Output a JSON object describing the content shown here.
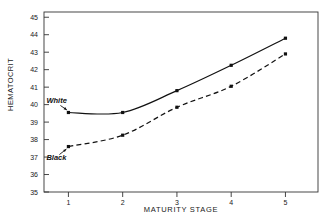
{
  "chart_data": {
    "type": "line",
    "title": "",
    "xlabel": "MATURITY STAGE",
    "ylabel": "HEMATOCRIT",
    "categories": [
      "1",
      "2",
      "3",
      "4",
      "5"
    ],
    "x": [
      1,
      2,
      3,
      4,
      5
    ],
    "xlim": [
      0.55,
      5.6
    ],
    "ylim": [
      35,
      45.3
    ],
    "ytick_labels": [
      "45",
      "44",
      "43",
      "42",
      "41",
      "40",
      "39",
      "38",
      "37",
      "36",
      "35"
    ],
    "yticks": [
      45,
      44,
      43,
      42,
      41,
      40,
      39,
      38,
      37,
      36,
      35
    ],
    "xtick_labels": [
      "1",
      "2",
      "3",
      "4",
      "5"
    ],
    "grid": false,
    "legend_position": "inline-annotations",
    "series": [
      {
        "name": "White",
        "label": "White",
        "style": "solid",
        "color": "#111111",
        "marker": "square",
        "values": [
          39.55,
          39.55,
          40.8,
          42.25,
          43.8
        ]
      },
      {
        "name": "Black",
        "label": "Black",
        "style": "dashed",
        "color": "#111111",
        "marker": "square",
        "values": [
          37.6,
          38.25,
          39.85,
          41.05,
          42.9
        ]
      }
    ],
    "annotations": [
      {
        "text": "White",
        "target_x": 1,
        "target_y": 39.55
      },
      {
        "text": "Black",
        "target_x": 1,
        "target_y": 37.6
      }
    ]
  }
}
